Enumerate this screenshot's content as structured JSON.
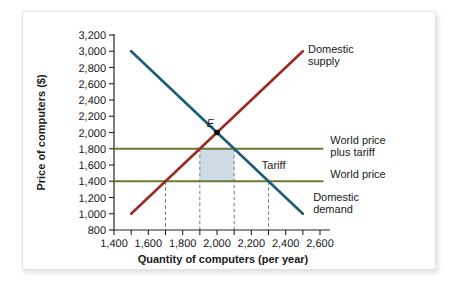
{
  "figure": {
    "background_color": "#ffffff",
    "card_border_color": "#e2e2e2"
  },
  "chart_data": {
    "type": "line",
    "title": "",
    "subtitle": "",
    "xlabel": "Quantity of computers (per year)",
    "ylabel": "Price of computers ($)",
    "xlim": [
      1400,
      2600
    ],
    "ylim": [
      800,
      3200
    ],
    "xticks": [
      1400,
      1500,
      1600,
      1700,
      1800,
      1900,
      2000,
      2100,
      2200,
      2300,
      2400,
      2500,
      2600
    ],
    "xtick_labels": [
      "1,400",
      "1,600",
      "1,800",
      "2,000",
      "2,200",
      "2,400",
      "2,600"
    ],
    "xtick_label_values": [
      1400,
      1600,
      1800,
      2000,
      2200,
      2400,
      2600
    ],
    "yticks": [
      800,
      1000,
      1200,
      1400,
      1600,
      1800,
      2000,
      2200,
      2400,
      2600,
      2800,
      3000,
      3200
    ],
    "ytick_labels": [
      "800",
      "1,000",
      "1,200",
      "1,400",
      "1,600",
      "1,800",
      "2,000",
      "2,200",
      "2,400",
      "2,600",
      "2,800",
      "3,000",
      "3,200"
    ],
    "grid": false,
    "legend_position": "right-inline",
    "series": [
      {
        "name": "Domestic supply",
        "label": "Domestic supply",
        "label_line_1": "Domestic",
        "label_line_2": "supply",
        "color": "#9e2a21",
        "type": "line",
        "x": [
          1500,
          2500
        ],
        "y": [
          1000,
          3000
        ]
      },
      {
        "name": "Domestic demand",
        "label": "Domestic demand",
        "label_line_1": "Domestic",
        "label_line_2": "demand",
        "color": "#1c5d78",
        "type": "line",
        "x": [
          1500,
          2500
        ],
        "y": [
          3000,
          1000
        ]
      },
      {
        "name": "World price plus tariff",
        "label": "World price plus tariff",
        "label_line_1": "World price",
        "label_line_2": "plus tariff",
        "color": "#6b7a33",
        "type": "hline",
        "y": 1800,
        "x": [
          1400,
          2620
        ]
      },
      {
        "name": "World price",
        "label": "World price",
        "label_line_1": "World price",
        "label_line_2": "",
        "color": "#6b7a33",
        "type": "hline",
        "y": 1400,
        "x": [
          1400,
          2620
        ]
      }
    ],
    "annotations": [
      {
        "name": "equilibrium-point",
        "label": "E",
        "x": 2000,
        "y": 2000,
        "marker": "dot",
        "color": "#000000"
      },
      {
        "name": "tariff-label",
        "label": "Tariff",
        "x": 2330,
        "y": 1600
      }
    ],
    "shaded_region": {
      "name": "tariff-revenue-region",
      "fill": "#c3d5e0",
      "opacity": 0.85,
      "y_bottom": 1400,
      "y_top": 1800,
      "x_left": 1900,
      "x_right": 2100
    },
    "dashed_lines": [
      {
        "name": "dashed-1700",
        "x": 1700,
        "y_top": 1400,
        "y_bottom": 800
      },
      {
        "name": "dashed-1900",
        "x": 1900,
        "y_top": 1800,
        "y_bottom": 800
      },
      {
        "name": "dashed-2100",
        "x": 2100,
        "y_top": 1800,
        "y_bottom": 800
      },
      {
        "name": "dashed-2300",
        "x": 2300,
        "y_top": 1400,
        "y_bottom": 800
      }
    ]
  }
}
